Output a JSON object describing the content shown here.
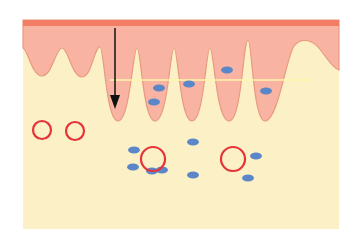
{
  "diagram": {
    "type": "tissue-cross-section",
    "colors": {
      "background": "#ffffff",
      "lower_tissue": "#fcf1c6",
      "upper_tissue": "#f8b3a2",
      "top_band": "#f47d66",
      "boundary_line": "#e89a80",
      "horizontal_line": "#fff6a8",
      "arrow": "#111111",
      "cell_dot": "#5b86c7",
      "ring": "#e5333a"
    },
    "panel": {
      "x": 23,
      "y": 20,
      "width": 316,
      "height": 209
    },
    "top_band": {
      "y": 20,
      "height": 6
    },
    "horizontal_line": {
      "y": 80,
      "x1": 110,
      "x2": 312
    },
    "arrow": {
      "x": 115,
      "y1": 28,
      "y2": 108
    },
    "dots": [
      {
        "cx": 159,
        "cy": 88
      },
      {
        "cx": 154,
        "cy": 102
      },
      {
        "cx": 189,
        "cy": 84
      },
      {
        "cx": 227,
        "cy": 70
      },
      {
        "cx": 266,
        "cy": 91
      },
      {
        "cx": 134,
        "cy": 150
      },
      {
        "cx": 133,
        "cy": 167
      },
      {
        "cx": 152,
        "cy": 171
      },
      {
        "cx": 162,
        "cy": 170
      },
      {
        "cx": 193,
        "cy": 142
      },
      {
        "cx": 193,
        "cy": 175
      },
      {
        "cx": 256,
        "cy": 156
      },
      {
        "cx": 248,
        "cy": 178
      }
    ],
    "rings": [
      {
        "cx": 42,
        "cy": 130,
        "r": 9
      },
      {
        "cx": 75,
        "cy": 131,
        "r": 9
      },
      {
        "cx": 153,
        "cy": 159,
        "r": 12
      },
      {
        "cx": 233,
        "cy": 159,
        "r": 12
      }
    ]
  }
}
